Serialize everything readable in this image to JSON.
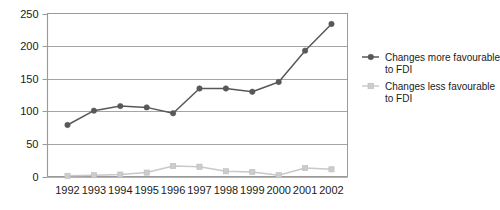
{
  "chart_data": {
    "type": "line",
    "title": "",
    "subtitle": "",
    "xlabel": "",
    "ylabel": "",
    "categories": [
      "1992",
      "1993",
      "1994",
      "1995",
      "1996",
      "1997",
      "1998",
      "1999",
      "2000",
      "2001",
      "2002"
    ],
    "x": [
      1992,
      1993,
      1994,
      1995,
      1996,
      1997,
      1998,
      1999,
      2000,
      2001,
      2002
    ],
    "series": [
      {
        "name": "Changes more favourable to FDI",
        "values": [
          79,
          101,
          108,
          106,
          97,
          135,
          135,
          130,
          145,
          193,
          234
        ],
        "color": "#585858",
        "marker": "circle"
      },
      {
        "name": "Changes less favourable to FDI",
        "values": [
          1,
          2,
          3,
          6,
          16,
          15,
          8,
          7,
          2,
          13,
          11
        ],
        "color": "#cccccc",
        "marker": "square"
      }
    ],
    "ylim": [
      0,
      250
    ],
    "yticks": [
      0,
      50,
      100,
      150,
      200,
      250
    ],
    "ytick_labels": [
      "0",
      "50",
      "100",
      "150",
      "200",
      "250"
    ],
    "grid": true,
    "grid_axis": "y",
    "legend_position": "right",
    "legend": [
      {
        "label_line1": "Changes more favourable",
        "label_line2": "to FDI"
      },
      {
        "label_line1": "Changes less favourable",
        "label_line2": "to FDI"
      }
    ]
  },
  "colors": {
    "background": "#ffffff",
    "grid": "#9a9a9a",
    "frame": "#9a9a9a",
    "axis": "#6a6a6a",
    "text": "#1a1a1a",
    "series_more_favourable": "#585858",
    "series_less_favourable": "#cccccc"
  }
}
